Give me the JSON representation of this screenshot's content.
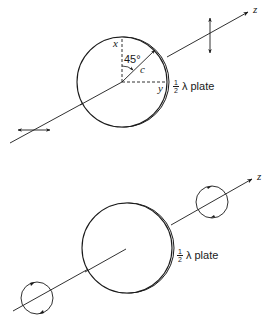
{
  "figure_top": {
    "title": "Linear polarization rotated by half-wave plate",
    "axis_label": "z",
    "x_label": "x",
    "y_label": "y",
    "angle_label": "45°",
    "c_label": "c",
    "plate_label": {
      "fraction_num": "1",
      "fraction_den": "2",
      "text": "λ plate"
    },
    "input_polarization": "horizontal-linear",
    "output_polarization": "vertical-linear"
  },
  "figure_bottom": {
    "title": "Circular polarization reversed by half-wave plate",
    "axis_label": "z",
    "plate_label": {
      "fraction_num": "1",
      "fraction_den": "2",
      "text": "λ plate"
    },
    "input_polarization": "circular",
    "output_polarization": "circular-reversed"
  },
  "colors": {
    "stroke": "#1a1a1a",
    "background": "#ffffff"
  }
}
